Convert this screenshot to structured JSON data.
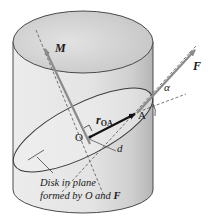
{
  "figure": {
    "labels": {
      "moment": "M",
      "force": "F",
      "angle": "α",
      "position_vector_main": "r",
      "position_vector_sub": "OA",
      "origin": "O",
      "point_a": "A",
      "distance": "d",
      "caption_line1": "Disk in plane",
      "caption_line2_prefix": "formed by O and ",
      "caption_line2_bold": "F"
    },
    "colors": {
      "cylinder_body": "#e6e6e6",
      "cylinder_shade": "#bdbdbd",
      "cylinder_top": "#d2d2d2",
      "outline": "#4a4a4a",
      "vector_gray": "#8a8a8a",
      "r_vector": "#111111",
      "disk_fill": "#efefef"
    }
  }
}
